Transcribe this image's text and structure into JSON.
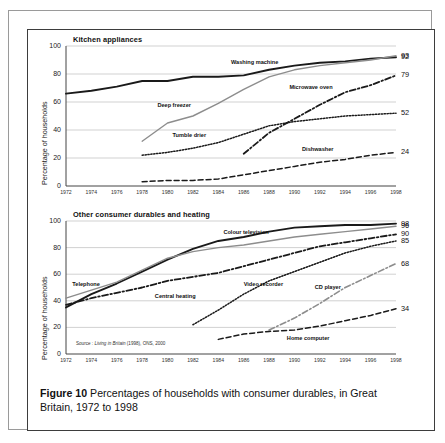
{
  "figure": {
    "caption_label": "Figure 10",
    "caption_text": "Percentages of households with consumer durables, in Great Britain, 1972 to 1998",
    "source": "Source : Living in Britain (1998), ONS, 2000",
    "source_italic": "Living in Britain",
    "source_prefix": "Source : ",
    "source_suffix": " (1998), ONS, 2000"
  },
  "chart_data": [
    {
      "type": "line",
      "title": "Kitchen appliances",
      "xlabel": "",
      "ylabel": "Percentage of households",
      "xlim": [
        1972,
        1998
      ],
      "ylim": [
        0,
        100
      ],
      "yticks": [
        0,
        20,
        40,
        60,
        80,
        100
      ],
      "xticks": [
        1972,
        1974,
        1976,
        1978,
        1980,
        1982,
        1984,
        1986,
        1988,
        1990,
        1992,
        1994,
        1996,
        1998
      ],
      "grid": true,
      "legend": "inline-labels",
      "series": [
        {
          "name": "Washing machine",
          "style": "solid-thick",
          "color": "#1a1a1a",
          "end_value": 92,
          "label_x": 1985.0,
          "label_y": 88,
          "x": [
            1972,
            1974,
            1976,
            1978,
            1980,
            1982,
            1984,
            1986,
            1988,
            1990,
            1992,
            1994,
            1996,
            1998
          ],
          "y": [
            66,
            68,
            71,
            75,
            75,
            78,
            78,
            79,
            83,
            86,
            88,
            89,
            91,
            92
          ]
        },
        {
          "name": "Deep freezer",
          "style": "solid-gray",
          "color": "#8d8d8d",
          "end_value": 93,
          "label_x": 1979.2,
          "label_y": 57,
          "x": [
            1978,
            1980,
            1982,
            1984,
            1986,
            1988,
            1990,
            1992,
            1994,
            1996,
            1998
          ],
          "y": [
            32,
            45,
            50,
            59,
            69,
            78,
            83,
            86,
            88,
            90,
            93
          ]
        },
        {
          "name": "Microwave oven",
          "style": "dashdot",
          "color": "#1a1a1a",
          "end_value": 79,
          "label_x": 1989.6,
          "label_y": 70,
          "x": [
            1986,
            1988,
            1990,
            1992,
            1994,
            1996,
            1998
          ],
          "y": [
            23,
            38,
            48,
            58,
            67,
            72,
            79
          ]
        },
        {
          "name": "Tumble drier",
          "style": "dotted",
          "color": "#1a1a1a",
          "end_value": 52,
          "label_x": 1980.4,
          "label_y": 36,
          "x": [
            1978,
            1980,
            1982,
            1984,
            1986,
            1988,
            1990,
            1992,
            1994,
            1996,
            1998
          ],
          "y": [
            22,
            24,
            27,
            31,
            37,
            43,
            46,
            48,
            50,
            51,
            52
          ]
        },
        {
          "name": "Dishwasher",
          "style": "dashed",
          "color": "#1a1a1a",
          "end_value": 24,
          "label_x": 1990.6,
          "label_y": 26,
          "x": [
            1978,
            1980,
            1982,
            1984,
            1986,
            1988,
            1990,
            1992,
            1994,
            1996,
            1998
          ],
          "y": [
            3,
            4,
            4,
            5,
            8,
            11,
            14,
            17,
            19,
            22,
            24
          ]
        }
      ],
      "end_labels": [
        93,
        92,
        79,
        52,
        24
      ]
    },
    {
      "type": "line",
      "title": "Other consumer durables and heating",
      "xlabel": "",
      "ylabel": "Percentage of households",
      "xlim": [
        1972,
        1998
      ],
      "ylim": [
        0,
        100
      ],
      "yticks": [
        0,
        20,
        40,
        60,
        80,
        100
      ],
      "xticks": [
        1972,
        1974,
        1976,
        1978,
        1980,
        1982,
        1984,
        1986,
        1988,
        1990,
        1992,
        1994,
        1996,
        1998
      ],
      "grid": true,
      "legend": "inline-labels",
      "series": [
        {
          "name": "Colour television",
          "style": "solid-thick",
          "color": "#1a1a1a",
          "end_value": 98,
          "label_x": 1984.4,
          "label_y": 91,
          "x": [
            1972,
            1974,
            1976,
            1978,
            1980,
            1982,
            1984,
            1986,
            1988,
            1990,
            1992,
            1994,
            1996,
            1998
          ],
          "y": [
            35,
            45,
            53,
            62,
            71,
            79,
            85,
            88,
            92,
            95,
            96,
            97,
            97,
            98
          ]
        },
        {
          "name": "Telephone",
          "style": "solid-gray",
          "color": "#8d8d8d",
          "end_value": 96,
          "label_x": 1972.5,
          "label_y": 52,
          "x": [
            1972,
            1974,
            1976,
            1978,
            1980,
            1982,
            1984,
            1986,
            1988,
            1990,
            1992,
            1994,
            1996,
            1998
          ],
          "y": [
            42,
            48,
            54,
            63,
            72,
            77,
            80,
            82,
            85,
            88,
            90,
            92,
            94,
            96
          ]
        },
        {
          "name": "Central heating",
          "style": "dashdot",
          "color": "#1a1a1a",
          "end_value": 90,
          "label_x": 1979.0,
          "label_y": 43,
          "x": [
            1972,
            1974,
            1976,
            1978,
            1980,
            1982,
            1984,
            1986,
            1988,
            1990,
            1992,
            1994,
            1996,
            1998
          ],
          "y": [
            37,
            42,
            46,
            50,
            55,
            58,
            61,
            66,
            71,
            76,
            81,
            84,
            87,
            90
          ]
        },
        {
          "name": "Video recorder",
          "style": "dotted",
          "color": "#1a1a1a",
          "end_value": 85,
          "label_x": 1986.0,
          "label_y": 52,
          "x": [
            1982,
            1984,
            1986,
            1988,
            1990,
            1992,
            1994,
            1996,
            1998
          ],
          "y": [
            22,
            33,
            45,
            55,
            62,
            69,
            76,
            81,
            85
          ]
        },
        {
          "name": "CD player",
          "style": "dashdot-gray",
          "color": "#8d8d8d",
          "end_value": 68,
          "label_x": 1991.6,
          "label_y": 50,
          "x": [
            1988,
            1990,
            1992,
            1994,
            1996,
            1998
          ],
          "y": [
            18,
            27,
            38,
            50,
            59,
            68
          ]
        },
        {
          "name": "Home computer",
          "style": "dashed",
          "color": "#1a1a1a",
          "end_value": 34,
          "label_x": 1989.4,
          "label_y": 11,
          "x": [
            1984,
            1986,
            1988,
            1990,
            1992,
            1994,
            1996,
            1998
          ],
          "y": [
            11,
            15,
            17,
            18,
            21,
            25,
            29,
            34
          ]
        }
      ],
      "end_labels": [
        98,
        96,
        90,
        85,
        68,
        34
      ]
    }
  ]
}
